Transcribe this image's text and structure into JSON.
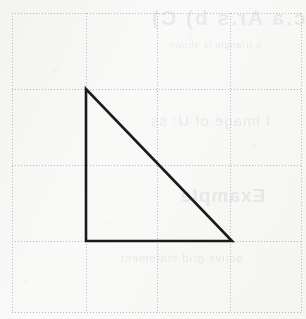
{
  "page": {
    "width": 306,
    "height": 319,
    "background_color": "#fbfbfa"
  },
  "colors": {
    "paper": "#fbfbfa",
    "grid_line": "#b9bcc2",
    "figure_stroke": "#1a1a1a",
    "bleed_text": "#9aa0a6"
  },
  "grid": {
    "type": "dotted",
    "line_color": "#b9bcc2",
    "line_width": 1,
    "dash_pattern": "1 2",
    "cell_size": 75,
    "columns": 4,
    "rows": 4,
    "x_lines": [
      12,
      86,
      157,
      230,
      301
    ],
    "y_lines": [
      13,
      89,
      165,
      241,
      312
    ],
    "origin": {
      "x": 12,
      "y": 13
    },
    "extent": {
      "x": 301,
      "y": 312
    }
  },
  "figure": {
    "name": "right-triangle",
    "shape": "triangle",
    "kind": "right triangle",
    "stroke_color": "#1a1a1a",
    "stroke_width": 2.6,
    "fill": "none",
    "vertices": [
      {
        "label": "apex",
        "x": 86,
        "y": 89,
        "grid_col": 1,
        "grid_row": 1
      },
      {
        "label": "right-angle",
        "x": 86,
        "y": 241,
        "grid_col": 1,
        "grid_row": 3
      },
      {
        "label": "bottom-right",
        "x": 232,
        "y": 241,
        "grid_col": 3,
        "grid_row": 3
      }
    ],
    "edges": [
      {
        "name": "vertical-leg",
        "from": "apex",
        "to": "right-angle",
        "length_px": 152,
        "length_cells": 2
      },
      {
        "name": "horizontal-leg",
        "from": "right-angle",
        "to": "bottom-right",
        "length_px": 146,
        "length_cells": 2
      },
      {
        "name": "hypotenuse",
        "from": "apex",
        "to": "bottom-right",
        "slope": -1,
        "passes_through": {
          "x": 157,
          "y": 165
        }
      }
    ],
    "right_angle_at": "right-angle"
  },
  "bleed_through": {
    "visible": true,
    "mirrored": true,
    "lines": [
      {
        "id": "line-1",
        "text": "Ic.a  Ar.s b) C)"
      },
      {
        "id": "line-2",
        "text": "a triangle is shown"
      },
      {
        "id": "line-3",
        "text": "t image of U: ss"
      },
      {
        "id": "line-4",
        "text": "Example"
      },
      {
        "id": "line-5",
        "text": "active grid statement"
      }
    ]
  }
}
